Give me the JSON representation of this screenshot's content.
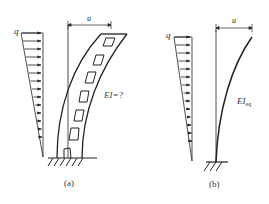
{
  "figure": {
    "panel_a": {
      "load_label": "q",
      "displacement_label": "u",
      "stiffness_label": "EI=?",
      "caption": "(a)",
      "description": "Coupled shear wall with openings, fixed at base, under triangular lateral load, deflecting by u at top"
    },
    "panel_b": {
      "load_label": "q",
      "displacement_label": "u",
      "stiffness_label_main": "EI",
      "stiffness_label_sub": "eq",
      "caption": "(b)",
      "description": "Equivalent cantilever with stiffness EI_eq under same triangular load, same top deflection u"
    },
    "colors": {
      "line": "#222222",
      "background": "#ffffff"
    }
  }
}
